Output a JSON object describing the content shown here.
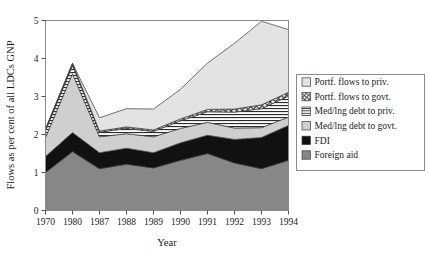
{
  "chart_data": {
    "type": "area",
    "stacked": true,
    "title": "",
    "xlabel": "Year",
    "ylabel": "Flows as per cent of all LDCs GNP",
    "categories": [
      "1970",
      "1980",
      "1987",
      "1988",
      "1989",
      "1990",
      "1991",
      "1992",
      "1993",
      "1994"
    ],
    "x": [
      1970,
      1980,
      1987,
      1988,
      1989,
      1990,
      1991,
      1992,
      1993,
      1994
    ],
    "ylim": [
      0,
      5
    ],
    "xlim_labels": [
      "1970",
      "1994"
    ],
    "y_ticks": [
      "0",
      "1",
      "2",
      "3",
      "4",
      "5"
    ],
    "y_tick_values": [
      0,
      1,
      2,
      3,
      4,
      5
    ],
    "grid": false,
    "legend_position": "right",
    "series": [
      {
        "name": "Foreign aid",
        "key": "foreign_aid",
        "fill": "#878787",
        "pattern": "solid",
        "values": [
          1.0,
          1.55,
          1.1,
          1.22,
          1.12,
          1.32,
          1.5,
          1.25,
          1.1,
          1.32
        ]
      },
      {
        "name": "FDI",
        "key": "fdi",
        "fill": "#111111",
        "pattern": "solid",
        "values": [
          0.42,
          0.5,
          0.42,
          0.42,
          0.4,
          0.46,
          0.48,
          0.62,
          0.82,
          0.92
        ]
      },
      {
        "name": "Med/lng debt to govt.",
        "key": "med_lng_debt_govt",
        "fill": "#cfcfcf",
        "pattern": "solid",
        "values": [
          0.5,
          1.55,
          0.42,
          0.38,
          0.42,
          0.38,
          0.34,
          0.3,
          0.26,
          0.22
        ]
      },
      {
        "name": "Med/lng debt to priv.",
        "key": "med_lng_debt_priv",
        "fill": "#f2f2f2",
        "pattern": "horizontal-hatch",
        "values": [
          0.18,
          0.22,
          0.12,
          0.14,
          0.14,
          0.2,
          0.28,
          0.42,
          0.5,
          0.55
        ]
      },
      {
        "name": "Portf. flows to govt.",
        "key": "portf_flows_govt",
        "fill": "#e8e8e8",
        "pattern": "cross-hatch",
        "values": [
          0.04,
          0.05,
          0.03,
          0.04,
          0.04,
          0.05,
          0.06,
          0.08,
          0.1,
          0.1
        ]
      },
      {
        "name": "Portf. flows to priv.",
        "key": "portf_flows_priv",
        "fill": "#e3e3e3",
        "pattern": "solid-light",
        "values": [
          0.0,
          0.0,
          0.35,
          0.48,
          0.55,
          0.78,
          1.22,
          1.73,
          2.2,
          1.65
        ]
      }
    ],
    "legend_entries": [
      {
        "label": "Portf. flows to priv.",
        "swatch": "solid-light"
      },
      {
        "label": "Portf. flows to govt.",
        "swatch": "cross-hatch"
      },
      {
        "label": "Med/lng debt to priv.",
        "swatch": "horizontal-hatch"
      },
      {
        "label": "Med/lng debt to govt.",
        "swatch": "solid-gray-light"
      },
      {
        "label": "FDI",
        "swatch": "solid-black"
      },
      {
        "label": "Foreign aid",
        "swatch": "solid-gray-mid"
      }
    ],
    "colors": {
      "foreign_aid": "#878787",
      "fdi": "#111111",
      "med_lng_debt_govt": "#cfcfcf",
      "med_lng_debt_priv": "#f2f2f2",
      "portf_flows_govt": "#e8e8e8",
      "portf_flows_priv": "#e3e3e3",
      "axis": "#555555",
      "frame": "#888888",
      "text": "#1a1a1a"
    }
  }
}
